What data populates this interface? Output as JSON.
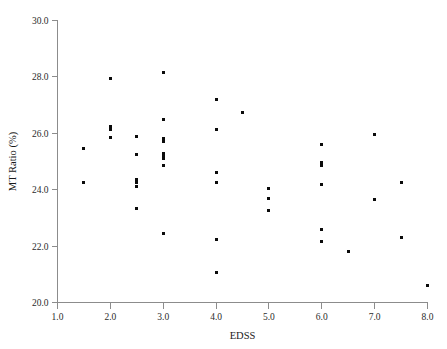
{
  "chart_data": {
    "type": "scatter",
    "title": "",
    "xlabel": "EDSS",
    "ylabel": "MT Ratio (%)",
    "xlim": [
      1.0,
      8.0
    ],
    "ylim": [
      20.0,
      30.0
    ],
    "xticks": [
      "1.0",
      "2.0",
      "3.0",
      "4.0",
      "5.0",
      "6.0",
      "7.0",
      "8.0"
    ],
    "xtick_values": [
      1.0,
      2.0,
      3.0,
      4.0,
      5.0,
      6.0,
      7.0,
      8.0
    ],
    "yticks": [
      "20.0",
      "22.0",
      "24.0",
      "26.0",
      "28.0",
      "30.0"
    ],
    "ytick_values": [
      20.0,
      22.0,
      24.0,
      26.0,
      28.0,
      30.0
    ],
    "grid": false,
    "legend": null,
    "marker": "square",
    "marker_color": "#0b0b0b",
    "marker_size_px": 3,
    "series": [
      {
        "name": "MT Ratio vs EDSS",
        "points": [
          [
            1.5,
            25.45
          ],
          [
            1.5,
            24.25
          ],
          [
            2.0,
            27.95
          ],
          [
            2.0,
            26.25
          ],
          [
            2.0,
            26.15
          ],
          [
            2.0,
            25.85
          ],
          [
            2.5,
            25.9
          ],
          [
            2.5,
            25.25
          ],
          [
            2.5,
            24.35
          ],
          [
            2.5,
            24.25
          ],
          [
            2.5,
            24.1
          ],
          [
            2.5,
            23.35
          ],
          [
            3.0,
            28.15
          ],
          [
            3.0,
            26.5
          ],
          [
            3.0,
            25.8
          ],
          [
            3.0,
            25.7
          ],
          [
            3.0,
            25.3
          ],
          [
            3.0,
            25.2
          ],
          [
            3.0,
            25.1
          ],
          [
            3.0,
            24.85
          ],
          [
            3.0,
            22.45
          ],
          [
            4.0,
            27.2
          ],
          [
            4.0,
            26.15
          ],
          [
            4.0,
            24.6
          ],
          [
            4.0,
            24.25
          ],
          [
            4.0,
            22.25
          ],
          [
            4.0,
            21.05
          ],
          [
            4.5,
            26.75
          ],
          [
            5.0,
            24.05
          ],
          [
            5.0,
            23.7
          ],
          [
            5.0,
            23.25
          ],
          [
            6.0,
            25.6
          ],
          [
            6.0,
            24.95
          ],
          [
            6.0,
            24.85
          ],
          [
            6.0,
            24.2
          ],
          [
            6.0,
            22.6
          ],
          [
            6.0,
            22.15
          ],
          [
            6.5,
            21.8
          ],
          [
            7.0,
            25.95
          ],
          [
            7.0,
            23.65
          ],
          [
            7.5,
            24.25
          ],
          [
            7.5,
            22.3
          ],
          [
            8.0,
            20.6
          ]
        ]
      }
    ]
  },
  "figure": {
    "background_color": "#ffffff",
    "axis_color": "#8c8c8c",
    "text_color": "#1a1a1a"
  }
}
